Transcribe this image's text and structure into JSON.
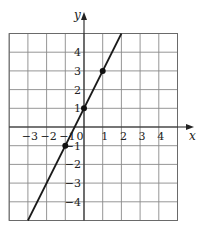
{
  "chart_data": {
    "type": "line",
    "title": "",
    "xlabel": "x",
    "ylabel": "y",
    "xlim": [
      -4,
      5
    ],
    "ylim": [
      -5,
      5
    ],
    "grid": true,
    "x_ticks": [
      -3,
      -2,
      -1,
      0,
      1,
      2,
      3,
      4
    ],
    "x_tick_labels": [
      "−3",
      "−2",
      "−1",
      "0",
      "1",
      "2",
      "3",
      "4"
    ],
    "y_ticks": [
      -4,
      -3,
      -2,
      -1,
      1,
      2,
      3,
      4
    ],
    "y_tick_labels": [
      "−4",
      "−3",
      "−2",
      "−1",
      "1",
      "2",
      "3",
      "4"
    ],
    "series": [
      {
        "name": "y = 2x + 1",
        "line_endpoints": [
          [
            -3,
            -5
          ],
          [
            2,
            5
          ]
        ],
        "marked_points": [
          [
            -1,
            -1
          ],
          [
            0,
            1
          ],
          [
            1,
            3
          ]
        ]
      }
    ]
  },
  "layout": {
    "origin_px": [
      84,
      127
    ],
    "unit_px": 18.7
  }
}
